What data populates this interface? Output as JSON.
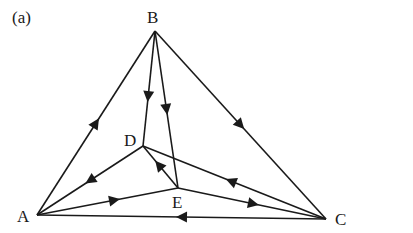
{
  "figure": {
    "panel_label": "(a)",
    "stroke_color": "#1a1a1a",
    "nodes": [
      {
        "id": "A",
        "label": "A",
        "x": 37,
        "y": 215
      },
      {
        "id": "B",
        "label": "B",
        "x": 155,
        "y": 31
      },
      {
        "id": "C",
        "label": "C",
        "x": 326,
        "y": 219
      },
      {
        "id": "D",
        "label": "D",
        "x": 143,
        "y": 146
      },
      {
        "id": "E",
        "label": "E",
        "x": 178,
        "y": 188
      }
    ],
    "edges": [
      {
        "from": "A",
        "to": "B",
        "arrow_t": 0.5
      },
      {
        "from": "B",
        "to": "C",
        "arrow_t": 0.5
      },
      {
        "from": "C",
        "to": "A",
        "arrow_t": 0.5
      },
      {
        "from": "B",
        "to": "D",
        "arrow_t": 0.57
      },
      {
        "from": "B",
        "to": "E",
        "arrow_t": 0.5
      },
      {
        "from": "D",
        "to": "A",
        "arrow_t": 0.5
      },
      {
        "from": "A",
        "to": "E",
        "arrow_t": 0.55
      },
      {
        "from": "E",
        "to": "D",
        "arrow_t": 0.55
      },
      {
        "from": "C",
        "to": "D",
        "arrow_t": 0.52
      },
      {
        "from": "E",
        "to": "C",
        "arrow_t": 0.51
      }
    ]
  }
}
